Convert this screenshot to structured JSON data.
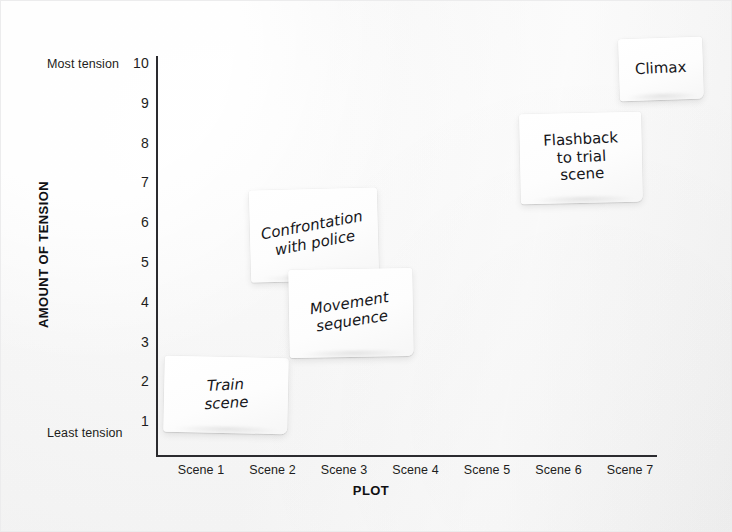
{
  "chart_data": {
    "type": "scatter",
    "title": "",
    "xlabel": "PLOT",
    "ylabel": "AMOUNT OF TENSION",
    "ylim": [
      0,
      10
    ],
    "yticks": [
      "10",
      "9",
      "8",
      "7",
      "6",
      "5",
      "4",
      "3",
      "2",
      "1"
    ],
    "y_axis_high_label": "Most tension",
    "y_axis_low_label": "Least tension",
    "categories": [
      "Scene 1",
      "Scene 2",
      "Scene 3",
      "Scene 4",
      "Scene 5",
      "Scene 6",
      "Scene 7"
    ],
    "grid": false,
    "legend": "none",
    "notes": [
      {
        "id": "train",
        "label": "Train\nscene",
        "scene": "Scene 1",
        "tension": 2
      },
      {
        "id": "confrontation",
        "label": "Confrontation\nwith police",
        "scene": "Scene 2",
        "tension": 6
      },
      {
        "id": "movement",
        "label": "Movement\nsequence",
        "scene": "Scene 3",
        "tension": 4
      },
      {
        "id": "flashback",
        "label": "Flashback\nto trial\nscene",
        "scene": "Scene 6",
        "tension": 8
      },
      {
        "id": "climax",
        "label": "Climax",
        "scene": "Scene 7",
        "tension": 10
      }
    ]
  },
  "colors": {
    "background": "#f6f6f6",
    "axis": "#2b2b2f",
    "text": "#1d1d20",
    "note": "#ffffff"
  }
}
